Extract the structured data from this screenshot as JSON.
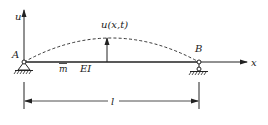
{
  "diagram": {
    "type": "simply-supported beam free vibration",
    "axes": {
      "vertical_label": "u",
      "horizontal_label": "x"
    },
    "supports": [
      {
        "id": "A",
        "label": "A",
        "kind": "pin"
      },
      {
        "id": "B",
        "label": "B",
        "kind": "roller"
      }
    ],
    "deflection_label": "u(x,t)",
    "mass_label": "m",
    "stiffness_label": "EI",
    "span_label": "l",
    "colors": {
      "line": "#222222",
      "background": "#ffffff"
    }
  }
}
